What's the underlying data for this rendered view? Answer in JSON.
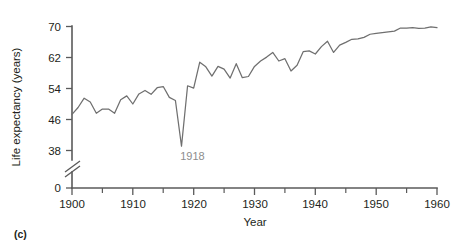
{
  "figure": {
    "caption": "(c)",
    "annotation": {
      "label": "1918",
      "x": 1918,
      "y": 39.1
    }
  },
  "chart_data": {
    "type": "line",
    "title": "",
    "xlabel": "Year",
    "ylabel": "Life expectancy (years)",
    "xlim": [
      1900,
      1960
    ],
    "ylim": [
      38,
      70
    ],
    "y_axis_break": true,
    "y_axis_break_between": [
      0,
      38
    ],
    "grid": false,
    "legend": false,
    "xticks": [
      1900,
      1905,
      1910,
      1915,
      1920,
      1925,
      1930,
      1935,
      1940,
      1945,
      1950,
      1955,
      1960
    ],
    "xtick_labels": [
      "1900",
      "",
      "1910",
      "",
      "1920",
      "",
      "1930",
      "",
      "1940",
      "",
      "1950",
      "",
      "1960"
    ],
    "yticks": [
      0,
      38,
      46,
      54,
      62,
      70
    ],
    "ytick_labels": [
      "0",
      "38",
      "46",
      "54",
      "62",
      "70"
    ],
    "series": [
      {
        "name": "Life expectancy at birth (United States)",
        "color": "#6f6f6f",
        "x": [
          1900,
          1901,
          1902,
          1903,
          1904,
          1905,
          1906,
          1907,
          1908,
          1909,
          1910,
          1911,
          1912,
          1913,
          1914,
          1915,
          1916,
          1917,
          1918,
          1919,
          1920,
          1921,
          1922,
          1923,
          1924,
          1925,
          1926,
          1927,
          1928,
          1929,
          1930,
          1931,
          1932,
          1933,
          1934,
          1935,
          1936,
          1937,
          1938,
          1939,
          1940,
          1941,
          1942,
          1943,
          1944,
          1945,
          1946,
          1947,
          1948,
          1949,
          1950,
          1951,
          1952,
          1953,
          1954,
          1955,
          1956,
          1957,
          1958,
          1959,
          1960
        ],
        "values": [
          47.3,
          49.1,
          51.5,
          50.5,
          47.6,
          48.7,
          48.7,
          47.6,
          51.1,
          52.1,
          50.0,
          52.6,
          53.5,
          52.5,
          54.2,
          54.5,
          51.7,
          50.9,
          39.1,
          54.7,
          54.1,
          60.8,
          59.6,
          57.2,
          59.7,
          59.0,
          56.7,
          60.4,
          56.8,
          57.1,
          59.7,
          61.1,
          62.1,
          63.3,
          61.1,
          61.7,
          58.5,
          60.0,
          63.5,
          63.7,
          62.9,
          64.8,
          66.2,
          63.3,
          65.2,
          65.9,
          66.7,
          66.8,
          67.2,
          68.0,
          68.2,
          68.4,
          68.6,
          68.8,
          69.6,
          69.6,
          69.7,
          69.5,
          69.6,
          69.9,
          69.7
        ]
      }
    ]
  }
}
